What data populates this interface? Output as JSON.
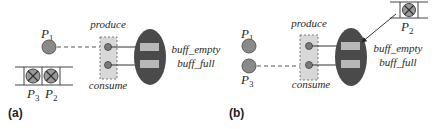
{
  "colors": {
    "process_fill": "#8a8a8a",
    "process_stroke": "#5a5a5a",
    "monitor_fill": "#4a4a4a",
    "monitor_slot_fill": "#b8b8b8",
    "entry_box_fill": "#d8d8d8",
    "entry_box_stroke": "#7a7a7a",
    "entry_dot_fill": "#7a7a7a",
    "line_color": "#333333",
    "queue_line": "#444444",
    "blocked_fill": "#9a9a9a"
  },
  "panels": [
    {
      "id": "a",
      "caption": "(a)",
      "processes": [
        {
          "name": "P",
          "sub": "1",
          "state": "active"
        }
      ],
      "queue": [
        {
          "name": "P",
          "sub": "3",
          "state": "blocked"
        },
        {
          "name": "P",
          "sub": "2",
          "state": "blocked"
        }
      ],
      "entries": {
        "top": "produce",
        "bottom": "consume"
      },
      "conditions": {
        "first": "buff_empty",
        "second": "buff_full"
      }
    },
    {
      "id": "b",
      "caption": "(b)",
      "processes": [
        {
          "name": "P",
          "sub": "1",
          "state": "active"
        },
        {
          "name": "P",
          "sub": "3",
          "state": "active"
        }
      ],
      "queue": [
        {
          "name": "P",
          "sub": "2",
          "state": "blocked"
        }
      ],
      "entries": {
        "top": "produce",
        "bottom": "consume"
      },
      "conditions": {
        "first": "buff_empty",
        "second": "buff_full"
      }
    }
  ]
}
